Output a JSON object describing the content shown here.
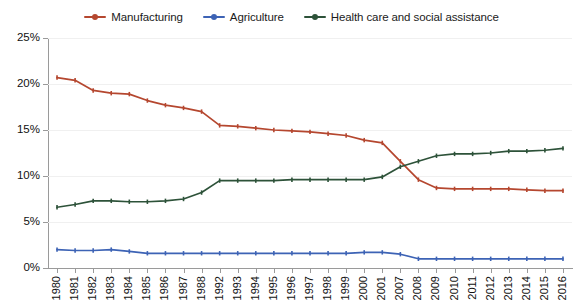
{
  "chart_data": {
    "type": "line",
    "title": "",
    "subtitle": "",
    "xlabel": "",
    "ylabel": "",
    "ylim": [
      0,
      25
    ],
    "ytick_values": [
      0,
      5,
      10,
      15,
      20,
      25
    ],
    "ytick_labels": [
      "0%",
      "5%",
      "10%",
      "15%",
      "20%",
      "25%"
    ],
    "grid": true,
    "legend_position": "top-center",
    "categories": [
      "1980",
      "1981",
      "1982",
      "1983",
      "1984",
      "1985",
      "1986",
      "1987",
      "1988",
      "1992",
      "1993",
      "1994",
      "1995",
      "1996",
      "1997",
      "1998",
      "1999",
      "2000",
      "2001",
      "2007",
      "2008",
      "2009",
      "2010",
      "2011",
      "2012",
      "2013",
      "2014",
      "2015",
      "2016"
    ],
    "series": [
      {
        "name": "Manufacturing",
        "color": "#b5472f",
        "values": [
          20.7,
          20.4,
          19.3,
          19.0,
          18.9,
          18.2,
          17.7,
          17.4,
          17.0,
          15.5,
          15.4,
          15.2,
          15.0,
          14.9,
          14.8,
          14.6,
          14.4,
          13.9,
          13.6,
          11.6,
          9.6,
          8.7,
          8.6,
          8.6,
          8.6,
          8.6,
          8.5,
          8.4,
          8.4
        ]
      },
      {
        "name": "Agriculture",
        "color": "#3d63b5",
        "values": [
          2.0,
          1.9,
          1.9,
          2.0,
          1.8,
          1.6,
          1.6,
          1.6,
          1.6,
          1.6,
          1.6,
          1.6,
          1.6,
          1.6,
          1.6,
          1.6,
          1.6,
          1.7,
          1.7,
          1.5,
          1.0,
          1.0,
          1.0,
          1.0,
          1.0,
          1.0,
          1.0,
          1.0,
          1.0
        ]
      },
      {
        "name": "Health care and social assistance",
        "color": "#2d5239",
        "values": [
          6.6,
          6.9,
          7.3,
          7.3,
          7.2,
          7.2,
          7.3,
          7.5,
          8.2,
          9.5,
          9.5,
          9.5,
          9.5,
          9.6,
          9.6,
          9.6,
          9.6,
          9.6,
          9.9,
          11.0,
          11.6,
          12.2,
          12.4,
          12.4,
          12.5,
          12.7,
          12.7,
          12.8,
          13.0
        ]
      }
    ]
  },
  "legend": {
    "items": [
      {
        "label": "Manufacturing",
        "color": "#b5472f"
      },
      {
        "label": "Agriculture",
        "color": "#3d63b5"
      },
      {
        "label": "Health care and social assistance",
        "color": "#2d5239"
      }
    ]
  },
  "axes": {
    "y_axis_name": "percent-axis",
    "x_axis_name": "year-axis"
  }
}
